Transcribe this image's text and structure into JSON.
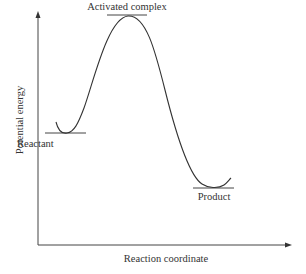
{
  "diagram": {
    "type": "energy-profile",
    "title": "",
    "axes": {
      "x_label": "Reaction coordinate",
      "y_label": "Potential energy"
    },
    "states": [
      {
        "id": "reactant",
        "label": "Reactant"
      },
      {
        "id": "activated_complex",
        "label": "Activated complex"
      },
      {
        "id": "product",
        "label": "Product"
      }
    ],
    "colors": {
      "line": "#333333",
      "background": "#ffffff"
    }
  }
}
